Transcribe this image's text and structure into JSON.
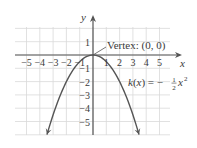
{
  "chart_data": {
    "type": "line",
    "title": "",
    "function_label": "k(x) = −½x²",
    "function_label_parts": {
      "lhs": "k(x) = −",
      "num": "1",
      "den": "2",
      "rhs": "x",
      "exp": "2"
    },
    "xlabel": "x",
    "ylabel": "y",
    "xlim": [
      -5.8,
      5.8
    ],
    "ylim": [
      -6,
      2
    ],
    "grid": true,
    "x_ticks": [
      -5,
      -4,
      -3,
      -2,
      -1,
      1,
      2,
      3,
      4,
      5
    ],
    "y_ticks": [
      1,
      -1,
      -2,
      -3,
      -4,
      -5
    ],
    "x_tick_labels": [
      "−5",
      "−4",
      "−3",
      "−2",
      "−1",
      "1",
      "2",
      "3",
      "4",
      "5"
    ],
    "y_tick_labels": [
      "1",
      "−1",
      "−2",
      "−3",
      "−4",
      "−5"
    ],
    "series": [
      {
        "name": "k(x) = -1/2 x^2",
        "x": [
          -3.46,
          -3,
          -2,
          -1,
          0,
          1,
          2,
          3,
          3.46
        ],
        "y": [
          -6,
          -4.5,
          -2,
          -0.5,
          0,
          -0.5,
          -2,
          -4.5,
          -6
        ]
      }
    ],
    "annotations": [
      {
        "text": "Vertex: (0, 0)",
        "point": [
          0,
          0
        ]
      }
    ]
  },
  "colors": {
    "grid": "#d9d9d9",
    "axis": "#555555",
    "curve": "#555555",
    "text": "#3a3a3a"
  }
}
